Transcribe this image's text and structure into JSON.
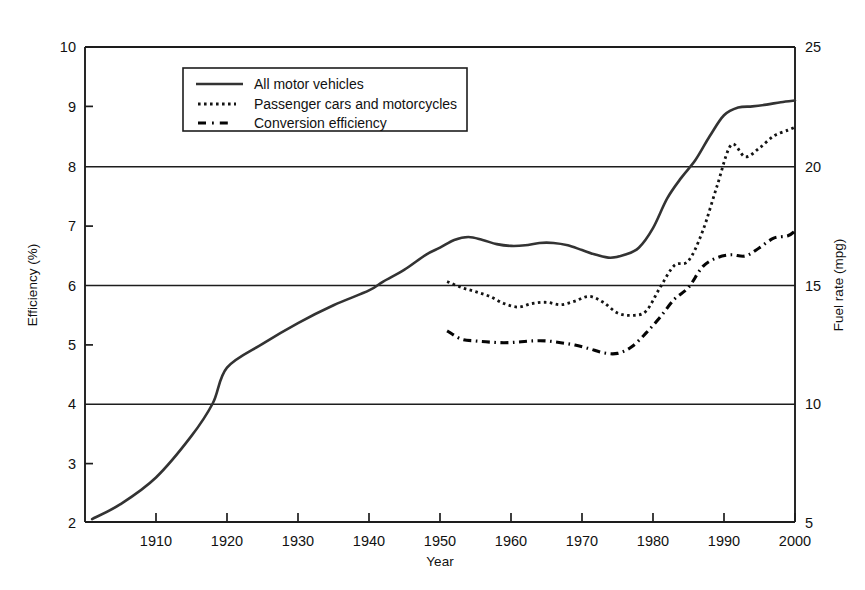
{
  "chart_data": {
    "type": "line",
    "title": "",
    "xlabel": "Year",
    "ylabel": "Efficiency (%)",
    "y2label": "Fuel rate (mpg)",
    "xlim": [
      1900,
      2000
    ],
    "ylim": [
      2,
      10
    ],
    "y2lim": [
      5,
      25
    ],
    "xticks": [
      1910,
      1920,
      1930,
      1940,
      1950,
      1960,
      1970,
      1980,
      1990,
      2000
    ],
    "xticklabels": [
      "1910",
      "1920",
      "1930",
      "1940",
      "1950",
      "1960",
      "1970",
      "1980",
      "1990",
      "2000"
    ],
    "yticks": [
      2,
      3,
      4,
      5,
      6,
      7,
      8,
      9,
      10
    ],
    "yticklabels": [
      "2",
      "3",
      "4",
      "5",
      "6",
      "7",
      "8",
      "9",
      "10"
    ],
    "y2ticks": [
      5,
      10,
      15,
      20,
      25
    ],
    "y2ticklabels": [
      "5",
      "10",
      "15",
      "20",
      "25"
    ],
    "grid": "horizontal gridlines at efficiency 4, 6, 8 (fuel rate 10, 15, 20)",
    "legend_position": "upper-left-inside",
    "series": [
      {
        "name": "All motor vehicles",
        "style": "solid",
        "x": [
          1901,
          1905,
          1910,
          1915,
          1918,
          1920,
          1925,
          1930,
          1935,
          1940,
          1942,
          1945,
          1948,
          1950,
          1952,
          1954,
          1956,
          1958,
          1960,
          1962,
          1964,
          1966,
          1968,
          1970,
          1972,
          1974,
          1976,
          1978,
          1980,
          1982,
          1984,
          1986,
          1988,
          1990,
          1992,
          1994,
          1996,
          1998,
          2000
        ],
        "y": [
          2.05,
          2.3,
          2.75,
          3.45,
          4.0,
          4.6,
          5.0,
          5.35,
          5.65,
          5.9,
          6.05,
          6.25,
          6.5,
          6.62,
          6.75,
          6.8,
          6.75,
          6.68,
          6.65,
          6.66,
          6.7,
          6.7,
          6.66,
          6.58,
          6.5,
          6.45,
          6.5,
          6.62,
          6.95,
          7.45,
          7.8,
          8.1,
          8.5,
          8.85,
          8.98,
          9.0,
          9.03,
          9.07,
          9.1
        ]
      },
      {
        "name": "Passenger cars and motorcycles",
        "style": "dotted",
        "x": [
          1951,
          1953,
          1955,
          1957,
          1959,
          1961,
          1963,
          1965,
          1967,
          1969,
          1971,
          1973,
          1975,
          1977,
          1979,
          1981,
          1983,
          1985,
          1987,
          1989,
          1991,
          1993,
          1995,
          1997,
          1999,
          2000
        ],
        "y": [
          6.05,
          5.95,
          5.88,
          5.8,
          5.68,
          5.62,
          5.68,
          5.7,
          5.66,
          5.72,
          5.8,
          5.7,
          5.52,
          5.48,
          5.55,
          5.95,
          6.32,
          6.4,
          6.9,
          7.65,
          8.35,
          8.15,
          8.3,
          8.5,
          8.6,
          8.65
        ]
      },
      {
        "name": "Conversion efficiency",
        "style": "dash-dot",
        "x": [
          1951,
          1953,
          1955,
          1957,
          1959,
          1961,
          1963,
          1965,
          1967,
          1969,
          1971,
          1973,
          1975,
          1977,
          1979,
          1981,
          1983,
          1985,
          1987,
          1989,
          1991,
          1993,
          1995,
          1997,
          1999,
          2000
        ],
        "y": [
          5.22,
          5.08,
          5.05,
          5.03,
          5.02,
          5.03,
          5.05,
          5.05,
          5.02,
          4.98,
          4.92,
          4.85,
          4.84,
          4.95,
          5.18,
          5.45,
          5.75,
          5.95,
          6.3,
          6.45,
          6.5,
          6.48,
          6.62,
          6.78,
          6.82,
          6.9
        ]
      }
    ]
  },
  "legend": {
    "entries": [
      {
        "label": "All motor vehicles",
        "style": "solid"
      },
      {
        "label": "Passenger cars and motorcycles",
        "style": "dotted"
      },
      {
        "label": "Conversion efficiency",
        "style": "dash-dot"
      }
    ]
  }
}
